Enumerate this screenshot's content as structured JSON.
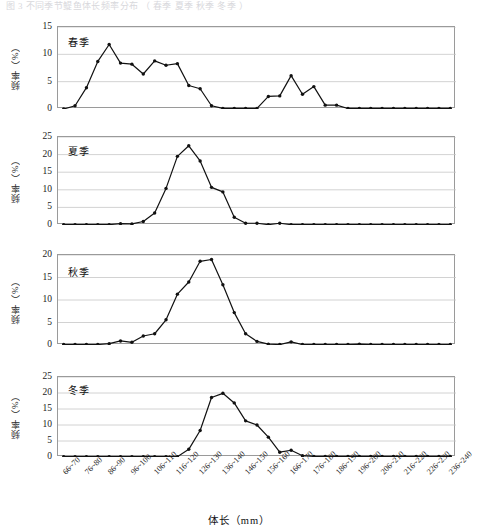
{
  "top_strip_text": "图 3  不同季节鳀鱼体长频率分布  （ 春季 夏季 秋季 冬季 ）",
  "axis": {
    "xlabel": "体长（mm）",
    "ylabel": "频率（%）",
    "categories": [
      "66~70",
      "71~75",
      "76~80",
      "81~85",
      "86~90",
      "91~95",
      "96~100",
      "101~105",
      "106~110",
      "111~115",
      "116~120",
      "121~125",
      "126~130",
      "131~135",
      "136~140",
      "141~145",
      "146~150",
      "151~155",
      "156~160",
      "161~165",
      "166~170",
      "171~175",
      "176~180",
      "181~185",
      "186~190",
      "191~195",
      "196~200",
      "201~205",
      "206~210",
      "211~215",
      "216~220",
      "221~225",
      "226~230",
      "231~235",
      "236~240"
    ],
    "tick_labels": [
      "66~70",
      "76~80",
      "86~90",
      "96~100",
      "106~110",
      "116~120",
      "126~130",
      "136~140",
      "146~150",
      "156~160",
      "166~170",
      "176~180",
      "186~190",
      "196~200",
      "206~210",
      "216~220",
      "226~230",
      "236~240"
    ]
  },
  "chart_data": [
    {
      "type": "line",
      "title": "春季",
      "xlabel": "体长（mm）",
      "ylabel": "频率（%）",
      "ylim": [
        0,
        15
      ],
      "yticks": [
        0,
        5,
        10,
        15
      ],
      "grid": true,
      "categories": [
        "66~70",
        "71~75",
        "76~80",
        "81~85",
        "86~90",
        "91~95",
        "96~100",
        "101~105",
        "106~110",
        "111~115",
        "116~120",
        "121~125",
        "126~130",
        "131~135",
        "136~140",
        "141~145",
        "146~150",
        "151~155",
        "156~160",
        "161~165",
        "166~170",
        "171~175",
        "176~180",
        "181~185",
        "186~190",
        "191~195",
        "196~200",
        "201~205",
        "206~210",
        "211~215",
        "216~220",
        "221~225",
        "226~230",
        "231~235",
        "236~240"
      ],
      "values": [
        0.0,
        0.6,
        3.9,
        8.7,
        11.8,
        8.4,
        8.2,
        6.4,
        8.8,
        8.0,
        8.3,
        4.3,
        3.7,
        0.6,
        0.1,
        0.1,
        0.1,
        0.1,
        2.3,
        2.4,
        6.1,
        2.7,
        4.1,
        0.7,
        0.7,
        0.1,
        0.1,
        0.1,
        0.1,
        0.1,
        0.1,
        0.1,
        0.1,
        0.1,
        0.1
      ]
    },
    {
      "type": "line",
      "title": "夏季",
      "xlabel": "体长（mm）",
      "ylabel": "频率（%）",
      "ylim": [
        0,
        25
      ],
      "yticks": [
        0,
        5,
        10,
        15,
        20,
        25
      ],
      "grid": true,
      "categories": [
        "66~70",
        "71~75",
        "76~80",
        "81~85",
        "86~90",
        "91~95",
        "96~100",
        "101~105",
        "106~110",
        "111~115",
        "116~120",
        "121~125",
        "126~130",
        "131~135",
        "136~140",
        "141~145",
        "146~150",
        "151~155",
        "156~160",
        "161~165",
        "166~170",
        "171~175",
        "176~180",
        "181~185",
        "186~190",
        "191~195",
        "196~200",
        "201~205",
        "206~210",
        "211~215",
        "216~220",
        "221~225",
        "226~230",
        "231~235",
        "236~240"
      ],
      "values": [
        0.1,
        0.1,
        0.1,
        0.1,
        0.1,
        0.4,
        0.3,
        1.0,
        3.4,
        10.4,
        19.5,
        22.5,
        18.2,
        10.7,
        9.4,
        2.2,
        0.5,
        0.5,
        0.1,
        0.5,
        0.1,
        0.1,
        0.1,
        0.1,
        0.1,
        0.1,
        0.1,
        0.1,
        0.1,
        0.1,
        0.1,
        0.1,
        0.1,
        0.1,
        0.1
      ]
    },
    {
      "type": "line",
      "title": "秋季",
      "xlabel": "体长（mm）",
      "ylabel": "频率（%）",
      "ylim": [
        0,
        20
      ],
      "yticks": [
        0,
        5,
        10,
        15,
        20
      ],
      "grid": true,
      "categories": [
        "66~70",
        "71~75",
        "76~80",
        "81~85",
        "86~90",
        "91~95",
        "96~100",
        "101~105",
        "106~110",
        "111~115",
        "116~120",
        "121~125",
        "126~130",
        "131~135",
        "136~140",
        "141~145",
        "146~150",
        "151~155",
        "156~160",
        "161~165",
        "166~170",
        "171~175",
        "176~180",
        "181~185",
        "186~190",
        "191~195",
        "196~200",
        "201~205",
        "206~210",
        "211~215",
        "216~220",
        "221~225",
        "226~230",
        "231~235",
        "236~240"
      ],
      "values": [
        0.1,
        0.1,
        0.1,
        0.1,
        0.3,
        0.9,
        0.6,
        2.0,
        2.5,
        5.6,
        11.3,
        14.0,
        18.6,
        19.0,
        13.4,
        7.2,
        2.5,
        0.8,
        0.2,
        0.1,
        0.7,
        0.1,
        0.1,
        0.1,
        0.1,
        0.1,
        0.2,
        0.1,
        0.1,
        0.1,
        0.1,
        0.1,
        0.1,
        0.1,
        0.1
      ]
    },
    {
      "type": "line",
      "title": "冬季",
      "xlabel": "体长（mm）",
      "ylabel": "频率（%）",
      "ylim": [
        0,
        25
      ],
      "yticks": [
        0,
        5,
        10,
        15,
        20,
        25
      ],
      "grid": true,
      "categories": [
        "66~70",
        "71~75",
        "76~80",
        "81~85",
        "86~90",
        "91~95",
        "96~100",
        "101~105",
        "106~110",
        "111~115",
        "116~120",
        "121~125",
        "126~130",
        "131~135",
        "136~140",
        "141~145",
        "146~150",
        "151~155",
        "156~160",
        "161~165",
        "166~170",
        "171~175",
        "176~180",
        "181~185",
        "186~190",
        "191~195",
        "196~200",
        "201~205",
        "206~210",
        "211~215",
        "216~220",
        "221~225",
        "226~230",
        "231~235",
        "236~240"
      ],
      "values": [
        0.1,
        0.1,
        0.1,
        0.1,
        0.1,
        0.1,
        0.1,
        0.1,
        0.1,
        0.1,
        0.1,
        2.4,
        8.3,
        18.6,
        19.9,
        16.9,
        11.3,
        10.0,
        6.2,
        1.5,
        2.1,
        0.4,
        0.2,
        0.2,
        0.2,
        0.2,
        0.2,
        0.2,
        0.2,
        0.2,
        0.2,
        0.2,
        0.2,
        0.2,
        0.2
      ]
    }
  ]
}
